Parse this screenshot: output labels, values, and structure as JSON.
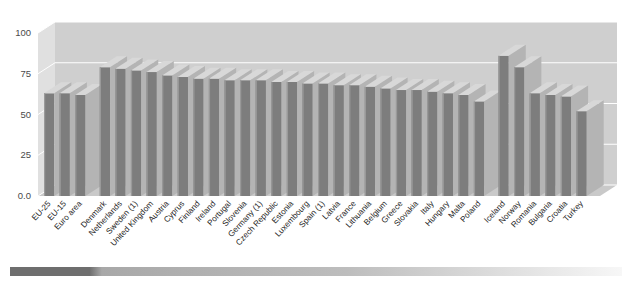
{
  "chart_data": {
    "type": "bar",
    "title": "",
    "subtitle": "",
    "xlabel": "",
    "ylabel": "",
    "ylim": [
      0,
      100
    ],
    "yticks": [
      "0.0",
      "25",
      "50",
      "75",
      "100"
    ],
    "ytick_values": [
      0,
      25,
      50,
      75,
      100
    ],
    "grid": true,
    "legend": "none",
    "style": "3d-bar",
    "series_name": "Employment rate (%)",
    "bar_color": "#7d7d7d",
    "bar_top_color": "#d8d8d8",
    "bar_side_color": "#b4b4b4",
    "plot_bg_color": "#d5d5d5",
    "wall_color": "#cfcfcf",
    "floor_color": "#c9c9c9",
    "categories": [
      "EU-25",
      "EU-15",
      "Euro area",
      "Denmark",
      "Netherlands",
      "Sweden (1)",
      "United Kingdom",
      "Austria",
      "Cyprus",
      "Finland",
      "Ireland",
      "Portugal",
      "Slovenia",
      "Germany (1)",
      "Czech Republic",
      "Estonia",
      "Luxembourg",
      "Spain (1)",
      "Latvia",
      "France",
      "Lithuania",
      "Belgium",
      "Greece",
      "Slovakia",
      "Italy",
      "Hungary",
      "Malta",
      "Poland",
      "Iceland",
      "Norway",
      "Romania",
      "Bulgaria",
      "Croatia",
      "Turkey"
    ],
    "values": [
      63,
      63,
      62,
      79,
      78,
      77,
      76,
      74,
      73,
      72,
      72,
      71,
      71,
      71,
      70,
      70,
      69,
      69,
      68,
      68,
      67,
      66,
      65,
      65,
      64,
      63,
      62,
      58,
      86,
      79,
      63,
      62,
      61,
      52
    ],
    "group_breaks": [
      3,
      28
    ],
    "notes": [
      "(1)"
    ]
  },
  "footer": {
    "gradient_bar_dark_color": "#6e6e6e",
    "gradient_bar_light_color": "#f2f2f2"
  }
}
